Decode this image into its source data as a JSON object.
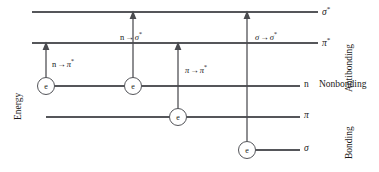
{
  "figure": {
    "axis_label": "Energy",
    "width": 379,
    "height": 172,
    "line_color": "#55565a",
    "text_color": "#1a1a1a",
    "background": "#ffffff"
  },
  "levels": [
    {
      "key": "sigma_star",
      "symbol": "σ",
      "star": "*",
      "label": "σ*",
      "y": 12,
      "x_start": 32,
      "x_end": 318,
      "label_x": 322,
      "label_y": 6,
      "electrons": 0
    },
    {
      "key": "pi_star",
      "symbol": "π",
      "star": "*",
      "label": "π*",
      "y": 43,
      "x_start": 32,
      "x_end": 318,
      "label_x": 322,
      "label_y": 37,
      "electrons": 0
    },
    {
      "key": "n",
      "symbol": "n",
      "star": "",
      "label": "n",
      "y": 86,
      "x_start": 46,
      "x_end": 300,
      "label_x": 304,
      "label_y": 81,
      "electrons": 2
    },
    {
      "key": "pi",
      "symbol": "π",
      "star": "",
      "label": "π",
      "y": 117,
      "x_start": 46,
      "x_end": 300,
      "label_x": 304,
      "label_y": 111,
      "electrons": 1
    },
    {
      "key": "sigma",
      "symbol": "σ",
      "star": "",
      "label": "σ",
      "y": 150,
      "x_start": 247,
      "x_end": 300,
      "label_x": 304,
      "label_y": 144,
      "electrons": 1
    }
  ],
  "electrons": [
    {
      "key": "electron-n-1",
      "glyph": "e",
      "cx": 46,
      "cy": 86,
      "r": 8.5,
      "level": "n"
    },
    {
      "key": "electron-n-2",
      "glyph": "e",
      "cx": 133,
      "cy": 86,
      "r": 8.5,
      "level": "n"
    },
    {
      "key": "electron-pi",
      "glyph": "e",
      "cx": 178,
      "cy": 117,
      "r": 8.5,
      "level": "pi"
    },
    {
      "key": "electron-sigma",
      "glyph": "e",
      "cx": 247,
      "cy": 150,
      "r": 8.5,
      "level": "sigma"
    }
  ],
  "transitions": [
    {
      "key": "n-to-pi-star",
      "from": "n",
      "to": "pi_star",
      "from_symbol": "n",
      "from_star": "",
      "to_symbol": "π",
      "to_star": "*",
      "arrow": "→",
      "label": "n → π*",
      "x": 46,
      "y_from": 86,
      "y_to": 43,
      "label_x": 52,
      "label_y": 58
    },
    {
      "key": "n-to-sigma-star",
      "from": "n",
      "to": "sigma_star",
      "from_symbol": "n",
      "from_star": "",
      "to_symbol": "σ",
      "to_star": "*",
      "arrow": "→",
      "label": "n → σ*",
      "x": 133,
      "y_from": 86,
      "y_to": 12,
      "label_x": 120,
      "label_y": 31
    },
    {
      "key": "pi-to-pi-star",
      "from": "pi",
      "to": "pi_star",
      "from_symbol": "π",
      "from_star": "",
      "to_symbol": "π",
      "to_star": "*",
      "arrow": "→",
      "label": "π → π*",
      "x": 178,
      "y_from": 117,
      "y_to": 43,
      "label_x": 185,
      "label_y": 64
    },
    {
      "key": "sigma-to-sigma-star",
      "from": "sigma",
      "to": "sigma_star",
      "from_symbol": "σ",
      "from_star": "",
      "to_symbol": "σ",
      "to_star": "*",
      "arrow": "→",
      "label": "σ → σ*",
      "x": 247,
      "y_from": 150,
      "y_to": 12,
      "label_x": 255,
      "label_y": 31
    }
  ],
  "groups": {
    "antibonding": {
      "label": "Antibonding",
      "x": 341,
      "y": 4,
      "orientation": "vertical"
    },
    "nonbonding": {
      "label": "Nonbonding",
      "x": 319,
      "y": 81,
      "orientation": "horizontal"
    },
    "bonding": {
      "label": "Bonding",
      "x": 341,
      "y": 106,
      "orientation": "vertical"
    }
  }
}
